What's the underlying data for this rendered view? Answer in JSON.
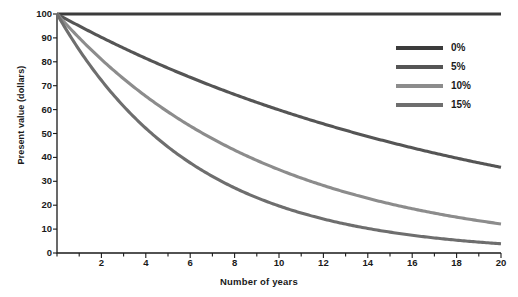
{
  "chart_data": {
    "type": "line",
    "title": "",
    "xlabel": "Number of years",
    "ylabel": "Present value (dollars)",
    "xlim": [
      0,
      20
    ],
    "ylim": [
      0,
      100
    ],
    "xticks": [
      2,
      4,
      6,
      8,
      10,
      12,
      14,
      16,
      18,
      20
    ],
    "yticks": [
      0,
      10,
      20,
      30,
      40,
      50,
      60,
      70,
      80,
      90,
      100
    ],
    "xtick_minor_step": 1,
    "grid": false,
    "legend_position": "upper right",
    "x": [
      0,
      1,
      2,
      3,
      4,
      5,
      6,
      7,
      8,
      9,
      10,
      11,
      12,
      13,
      14,
      15,
      16,
      17,
      18,
      19,
      20
    ],
    "series": [
      {
        "name": "0%",
        "color": "#3b3b3b",
        "rate": 0,
        "values": [
          100,
          100,
          100,
          100,
          100,
          100,
          100,
          100,
          100,
          100,
          100,
          100,
          100,
          100,
          100,
          100,
          100,
          100,
          100,
          100,
          100
        ]
      },
      {
        "name": "5%",
        "color": "#555555",
        "rate": 0.05,
        "values": [
          100,
          95,
          90,
          86,
          82,
          78,
          74,
          71,
          67,
          64,
          61,
          58,
          55,
          52,
          50,
          47,
          45,
          43,
          41,
          39,
          37
        ]
      },
      {
        "name": "10%",
        "color": "#8c8c8c",
        "rate": 0.1,
        "values": [
          100,
          94,
          88,
          81,
          75,
          69,
          64,
          59,
          54,
          49,
          45,
          41,
          38,
          34,
          31,
          28,
          26,
          23,
          21,
          19,
          15
        ]
      },
      {
        "name": "15%",
        "color": "#6e6e6e",
        "rate": 0.15,
        "values": [
          100,
          91,
          83,
          75,
          67,
          60,
          54,
          48,
          43,
          38,
          34,
          30,
          26,
          23,
          20,
          17,
          15,
          13,
          11,
          10,
          9
        ]
      }
    ]
  },
  "axis": {
    "line_color": "#1a1a1a",
    "ylabel": "Present value (dollars)",
    "xlabel": "Number of years",
    "ytick_labels": [
      "100",
      "90",
      "80",
      "70",
      "60",
      "50",
      "40",
      "30",
      "20",
      "10",
      "0"
    ],
    "xtick_labels": [
      "2",
      "4",
      "6",
      "8",
      "10",
      "12",
      "14",
      "16",
      "18",
      "20"
    ]
  },
  "legend": {
    "items": [
      {
        "label": "0%",
        "color": "#3b3b3b"
      },
      {
        "label": "5%",
        "color": "#555555"
      },
      {
        "label": "10%",
        "color": "#8c8c8c"
      },
      {
        "label": "15%",
        "color": "#6e6e6e"
      }
    ]
  }
}
